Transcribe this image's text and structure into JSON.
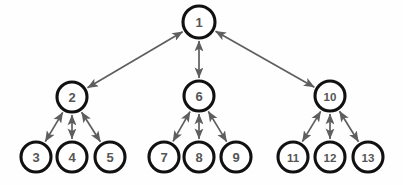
{
  "figure": {
    "title": "",
    "background_color": "#fefefe",
    "node_fill": "#ffffff",
    "node_stroke": "#111111",
    "node_label_color": "#555555",
    "edge_color": "#5e5e5e",
    "node_radius": 15,
    "edge_style": "double-headed-arrow",
    "watermark_text": ""
  },
  "graph": {
    "type": "tree",
    "directed": "bidirectional",
    "node_count": 13,
    "edge_count": 12,
    "levels": [
      {
        "level": 0,
        "y": 22,
        "node_ids": [
          "1"
        ]
      },
      {
        "level": 1,
        "y": 96,
        "node_ids": [
          "2",
          "6",
          "10"
        ]
      },
      {
        "level": 2,
        "y": 157,
        "node_ids": [
          "3",
          "4",
          "5",
          "7",
          "8",
          "9",
          "11",
          "12",
          "13"
        ]
      }
    ],
    "nodes": [
      {
        "id": "1",
        "label": "1",
        "cx": 199,
        "cy": 22,
        "r": 16
      },
      {
        "id": "2",
        "label": "2",
        "cx": 72,
        "cy": 97,
        "r": 15
      },
      {
        "id": "6",
        "label": "6",
        "cx": 199,
        "cy": 96,
        "r": 15
      },
      {
        "id": "10",
        "label": "10",
        "cx": 330,
        "cy": 96,
        "r": 15
      },
      {
        "id": "3",
        "label": "3",
        "cx": 36,
        "cy": 157,
        "r": 15
      },
      {
        "id": "4",
        "label": "4",
        "cx": 72,
        "cy": 157,
        "r": 15
      },
      {
        "id": "5",
        "label": "5",
        "cx": 110,
        "cy": 157,
        "r": 15
      },
      {
        "id": "7",
        "label": "7",
        "cx": 164,
        "cy": 157,
        "r": 15
      },
      {
        "id": "8",
        "label": "8",
        "cx": 199,
        "cy": 157,
        "r": 15
      },
      {
        "id": "9",
        "label": "9",
        "cx": 236,
        "cy": 157,
        "r": 15
      },
      {
        "id": "11",
        "label": "11",
        "cx": 293,
        "cy": 157,
        "r": 15
      },
      {
        "id": "12",
        "label": "12",
        "cx": 330,
        "cy": 157,
        "r": 15
      },
      {
        "id": "13",
        "label": "13",
        "cx": 368,
        "cy": 157,
        "r": 15
      }
    ],
    "edges": [
      {
        "from": "1",
        "to": "2"
      },
      {
        "from": "1",
        "to": "6"
      },
      {
        "from": "1",
        "to": "10"
      },
      {
        "from": "2",
        "to": "3"
      },
      {
        "from": "2",
        "to": "4"
      },
      {
        "from": "2",
        "to": "5"
      },
      {
        "from": "6",
        "to": "7"
      },
      {
        "from": "6",
        "to": "8"
      },
      {
        "from": "6",
        "to": "9"
      },
      {
        "from": "10",
        "to": "11"
      },
      {
        "from": "10",
        "to": "12"
      },
      {
        "from": "10",
        "to": "13"
      }
    ]
  }
}
